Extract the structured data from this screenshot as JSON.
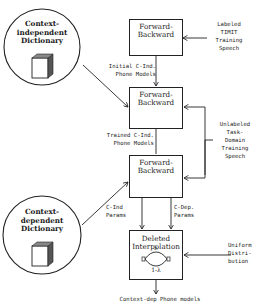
{
  "diagram": {
    "circles": [
      {
        "id": "context-independent-dictionary",
        "title_lines": [
          "Context-",
          "independent",
          "Dictionary"
        ]
      },
      {
        "id": "context-dependent-dictionary",
        "title_lines": [
          "Context-",
          "dependent",
          "Dictionary"
        ]
      }
    ],
    "boxes": [
      {
        "id": "forward-backward-1",
        "title_lines": [
          "Forward-",
          "Backward"
        ]
      },
      {
        "id": "forward-backward-2",
        "title_lines": [
          "Forward-",
          "Backward"
        ]
      },
      {
        "id": "forward-backward-3",
        "title_lines": [
          "Forward-",
          "Backward"
        ]
      },
      {
        "id": "deleted-interpolation",
        "title_lines": [
          "Deleted",
          "Interpolation"
        ],
        "lambda_top": "λ",
        "lambda_bottom": "1-λ"
      }
    ],
    "labels": {
      "labeled_timit": [
        "Labeled",
        "TIMIT",
        "Training",
        "Speech"
      ],
      "initial_models": [
        "Initial C-Ind.",
        "Phone Models"
      ],
      "trained_models": [
        "Trained C-Ind.",
        "Phone Models"
      ],
      "unlabeled_speech": [
        "Unlabeled",
        "Task-",
        "Domain",
        "Training",
        "Speech"
      ],
      "c_ind_params": [
        "C-Ind",
        "Params"
      ],
      "c_dep_params": [
        "C-Dep.",
        "Params"
      ],
      "uniform_distribution": [
        "Uniform",
        "Distri-",
        "bution"
      ],
      "output": "Context-dep Phone models"
    }
  }
}
